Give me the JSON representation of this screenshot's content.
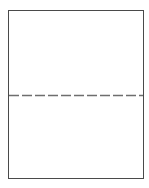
{
  "diagram": {
    "sheet": {
      "shape": "rectangle",
      "border_color": "#4a4a4a",
      "fill_color": "#ffffff"
    },
    "perforation": {
      "orientation": "horizontal",
      "style": "dashed",
      "color": "#6e6e6e",
      "dash_length": 10,
      "gap_length": 3
    }
  }
}
